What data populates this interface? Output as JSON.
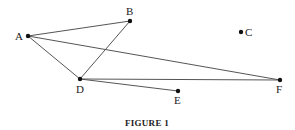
{
  "figure": {
    "caption": "FIGURE 1",
    "points": [
      {
        "id": "A",
        "label": "A",
        "x": 28,
        "y": 36
      },
      {
        "id": "B",
        "label": "B",
        "x": 130,
        "y": 21
      },
      {
        "id": "C",
        "label": "C",
        "x": 241,
        "y": 32
      },
      {
        "id": "D",
        "label": "D",
        "x": 80,
        "y": 79
      },
      {
        "id": "E",
        "label": "E",
        "x": 178,
        "y": 91
      },
      {
        "id": "F",
        "label": "F",
        "x": 280,
        "y": 80
      }
    ],
    "edges": [
      [
        "A",
        "B"
      ],
      [
        "A",
        "D"
      ],
      [
        "B",
        "D"
      ],
      [
        "A",
        "F"
      ],
      [
        "D",
        "F"
      ],
      [
        "D",
        "E"
      ]
    ],
    "line_color": "#555555",
    "point_color": "#111111"
  }
}
